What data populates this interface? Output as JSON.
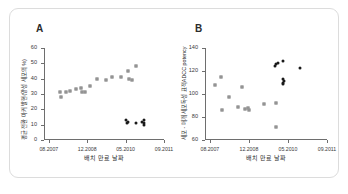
{
  "figure": {
    "panels": [
      {
        "letter": "A",
        "xlabel": "배치 만료 날짜",
        "ylabel": "평균 전환 마커 발현(양성 세포의 %)",
        "xticks": [
          "08.2007",
          "12.2008",
          "05.2010",
          "09.2011"
        ],
        "yticks": [
          "0",
          "10",
          "20",
          "30",
          "40",
          "50",
          "60"
        ]
      },
      {
        "letter": "B",
        "xlabel": "배치 만료 날짜",
        "ylabel": "세포 - 매개 세포독성 표적ADCC potency",
        "xticks": [
          "08.2007",
          "12.2008",
          "05.2010",
          "09.2011"
        ],
        "yticks": [
          "60",
          "80",
          "100",
          "120",
          "140"
        ]
      }
    ]
  },
  "chart_data": [
    {
      "type": "scatter",
      "panel": "A",
      "title": "A",
      "xlabel": "배치 만료 날짜",
      "ylabel": "평균 전환 마커 발현(양성 세포의 %)",
      "xlim": [
        0,
        100
      ],
      "ylim": [
        0,
        60
      ],
      "xtick_positions": [
        4,
        36,
        68,
        100
      ],
      "xtick_labels": [
        "08.2007",
        "12.2008",
        "05.2010",
        "09.2011"
      ],
      "ytick_values": [
        0,
        10,
        20,
        30,
        40,
        50,
        60
      ],
      "grid": false,
      "legend": null,
      "series": [
        {
          "name": "gray-open-squares",
          "color": "#a9a9a9",
          "marker": "square",
          "points": [
            {
              "x": 13,
              "y": 31
            },
            {
              "x": 14,
              "y": 28
            },
            {
              "x": 18,
              "y": 31
            },
            {
              "x": 22,
              "y": 32
            },
            {
              "x": 27,
              "y": 33
            },
            {
              "x": 31,
              "y": 34
            },
            {
              "x": 32,
              "y": 31
            },
            {
              "x": 34,
              "y": 31
            },
            {
              "x": 38,
              "y": 35
            },
            {
              "x": 44,
              "y": 40
            },
            {
              "x": 52,
              "y": 39
            },
            {
              "x": 57,
              "y": 41
            },
            {
              "x": 64,
              "y": 41
            },
            {
              "x": 70,
              "y": 45
            },
            {
              "x": 71,
              "y": 40
            },
            {
              "x": 73,
              "y": 39
            },
            {
              "x": 77,
              "y": 48
            }
          ]
        },
        {
          "name": "black-filled-points",
          "color": "#1a1a1a",
          "marker": "circle",
          "points": [
            {
              "x": 68,
              "y": 13
            },
            {
              "x": 69,
              "y": 11
            },
            {
              "x": 70,
              "y": 12
            },
            {
              "x": 77,
              "y": 11
            },
            {
              "x": 82,
              "y": 12
            },
            {
              "x": 83,
              "y": 11
            },
            {
              "x": 83,
              "y": 13
            },
            {
              "x": 83,
              "y": 10
            }
          ]
        }
      ]
    },
    {
      "type": "scatter",
      "panel": "B",
      "title": "B",
      "xlabel": "배치 만료 날짜",
      "ylabel": "세포 - 매개 세포독성 표적ADCC potency",
      "xlim": [
        0,
        100
      ],
      "ylim": [
        60,
        140
      ],
      "xtick_positions": [
        4,
        36,
        68,
        100
      ],
      "xtick_labels": [
        "08.2007",
        "12.2008",
        "05.2010",
        "09.2011"
      ],
      "ytick_values": [
        60,
        80,
        100,
        120,
        140
      ],
      "grid": false,
      "legend": null,
      "series": [
        {
          "name": "gray-open-squares",
          "color": "#a9a9a9",
          "marker": "square",
          "points": [
            {
              "x": 8,
              "y": 108
            },
            {
              "x": 13,
              "y": 115
            },
            {
              "x": 14,
              "y": 86
            },
            {
              "x": 20,
              "y": 97
            },
            {
              "x": 27,
              "y": 89
            },
            {
              "x": 30,
              "y": 106
            },
            {
              "x": 33,
              "y": 87
            },
            {
              "x": 35,
              "y": 88
            },
            {
              "x": 36,
              "y": 86
            },
            {
              "x": 48,
              "y": 91
            },
            {
              "x": 58,
              "y": 92
            },
            {
              "x": 58,
              "y": 71
            }
          ]
        },
        {
          "name": "black-filled-points",
          "color": "#1a1a1a",
          "marker": "circle",
          "points": [
            {
              "x": 57,
              "y": 124
            },
            {
              "x": 58,
              "y": 126
            },
            {
              "x": 60,
              "y": 127
            },
            {
              "x": 64,
              "y": 129
            },
            {
              "x": 64,
              "y": 113
            },
            {
              "x": 64,
              "y": 110
            },
            {
              "x": 64,
              "y": 109
            },
            {
              "x": 65,
              "y": 111
            },
            {
              "x": 78,
              "y": 123
            }
          ]
        }
      ]
    }
  ]
}
